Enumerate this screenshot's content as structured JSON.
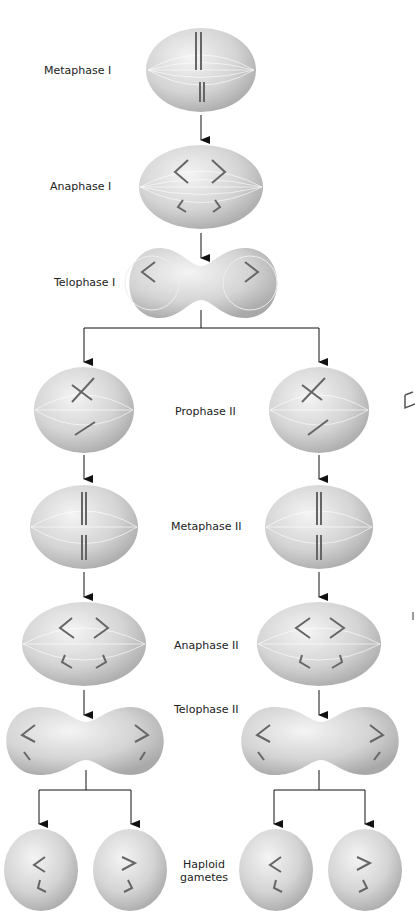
{
  "stages": {
    "metaphase_1": "Metaphase I",
    "anaphase_1": "Anaphase I",
    "telophase_1": "Telophase I",
    "prophase_2": "Prophase II",
    "metaphase_2": "Metaphase II",
    "anaphase_2": "Anaphase II",
    "telophase_2": "Telophase II",
    "gametes_line1": "Haploid",
    "gametes_line2": "gametes"
  },
  "colors": {
    "cell": "#d8d8d8",
    "cell_shadow": "#a8a8a8",
    "arrow": "#111111",
    "chromosome": "#666666"
  }
}
